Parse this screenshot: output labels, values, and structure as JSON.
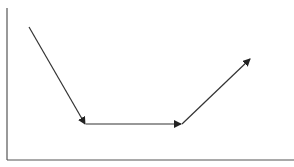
{
  "diagram": {
    "type": "arrow-path",
    "colors": {
      "axis": "#555555",
      "arrow": "#333333",
      "background": "#ffffff"
    },
    "axes": {
      "origin": [
        7,
        160
      ],
      "y_top": [
        7,
        8
      ],
      "x_right": [
        294,
        160
      ]
    },
    "segments": [
      {
        "from": [
          29,
          27
        ],
        "to": [
          85,
          124
        ],
        "label": ""
      },
      {
        "from": [
          86,
          124
        ],
        "to": [
          181,
          124
        ],
        "label": ""
      },
      {
        "from": [
          182,
          124
        ],
        "to": [
          250,
          59
        ],
        "label": ""
      }
    ]
  }
}
